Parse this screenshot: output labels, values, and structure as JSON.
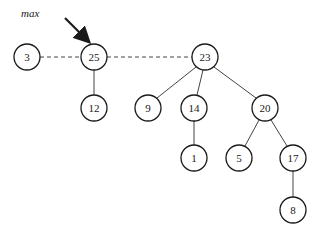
{
  "diagram": {
    "type": "heap-root-list",
    "pointer_label": "max",
    "pointer_target": "25",
    "colors": {
      "stroke": "#1a1a1a",
      "background": "#ffffff"
    },
    "nodes": [
      {
        "id": "n3",
        "label": "3",
        "x": 27,
        "y": 57
      },
      {
        "id": "n25",
        "label": "25",
        "x": 94,
        "y": 57
      },
      {
        "id": "n12",
        "label": "12",
        "x": 94,
        "y": 108
      },
      {
        "id": "n23",
        "label": "23",
        "x": 205,
        "y": 57
      },
      {
        "id": "n9",
        "label": "9",
        "x": 148,
        "y": 108
      },
      {
        "id": "n14",
        "label": "14",
        "x": 194,
        "y": 108
      },
      {
        "id": "n20",
        "label": "20",
        "x": 265,
        "y": 108
      },
      {
        "id": "n1",
        "label": "1",
        "x": 194,
        "y": 158
      },
      {
        "id": "n5",
        "label": "5",
        "x": 239,
        "y": 158
      },
      {
        "id": "n17",
        "label": "17",
        "x": 293,
        "y": 158
      },
      {
        "id": "n8",
        "label": "8",
        "x": 293,
        "y": 210
      }
    ],
    "root_list": [
      "3",
      "25",
      "23"
    ],
    "edges": [
      [
        "25",
        "12"
      ],
      [
        "23",
        "9"
      ],
      [
        "23",
        "14"
      ],
      [
        "23",
        "20"
      ],
      [
        "14",
        "1"
      ],
      [
        "20",
        "5"
      ],
      [
        "20",
        "17"
      ],
      [
        "17",
        "8"
      ]
    ]
  }
}
